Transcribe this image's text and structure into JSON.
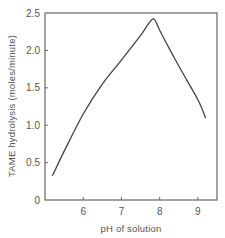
{
  "chart_data": {
    "type": "line",
    "title": "",
    "xlabel": "pH of solution",
    "ylabel": "TAME hydrolysis (moles/minute)",
    "xlim": [
      5.0,
      9.5
    ],
    "ylim": [
      0,
      2.5
    ],
    "xticks": [
      6,
      7,
      8,
      9
    ],
    "xtick_labels": [
      "6",
      "7",
      "8",
      "9"
    ],
    "yticks": [
      0,
      0.5,
      1.0,
      1.5,
      2.0,
      2.5
    ],
    "ytick_labels": [
      "0",
      "0.5",
      "1.0",
      "1.5",
      "2.0",
      "2.5"
    ],
    "grid": false,
    "legend": null,
    "series": [
      {
        "name": "TAME hydrolysis",
        "x": [
          5.2,
          5.5,
          6.0,
          6.5,
          7.0,
          7.5,
          7.7,
          7.85,
          8.0,
          8.3,
          8.6,
          9.0,
          9.2
        ],
        "values": [
          0.33,
          0.65,
          1.15,
          1.55,
          1.87,
          2.2,
          2.35,
          2.42,
          2.27,
          1.98,
          1.7,
          1.34,
          1.1
        ]
      }
    ]
  }
}
